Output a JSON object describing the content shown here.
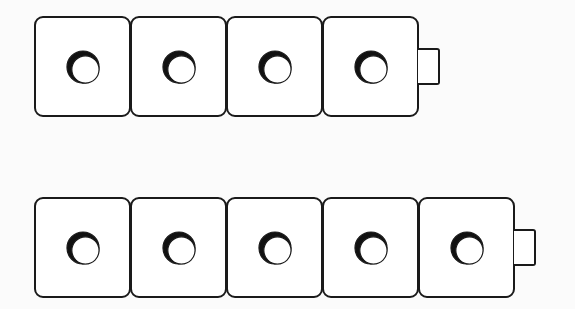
{
  "diagram": {
    "colors": {
      "outline": "#1a1a1a",
      "fill": "#ffffff",
      "background": "#fbfbfb",
      "shadow": "#111111"
    },
    "rows": [
      {
        "name": "top-row",
        "cube_count": 4,
        "has_connector": true
      },
      {
        "name": "bottom-row",
        "cube_count": 5,
        "has_connector": true
      }
    ]
  }
}
